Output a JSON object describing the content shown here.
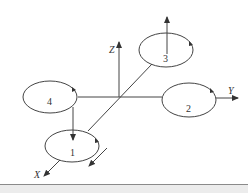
{
  "diagram": {
    "type": "quadrotor-coordinate-frame",
    "axes": [
      {
        "name": "X",
        "label": "X"
      },
      {
        "name": "Y",
        "label": "Y"
      },
      {
        "name": "Z",
        "label": "Z"
      }
    ],
    "rotors": [
      {
        "id": 1,
        "label": "1"
      },
      {
        "id": 2,
        "label": "2"
      },
      {
        "id": 3,
        "label": "3"
      },
      {
        "id": 4,
        "label": "4"
      }
    ],
    "colors": {
      "stroke": "#444444",
      "background": "#ffffff",
      "footer": "#ececec"
    }
  }
}
